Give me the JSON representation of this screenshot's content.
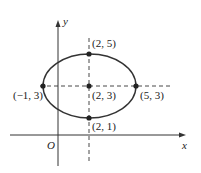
{
  "diagram": {
    "type": "ellipse-on-axes",
    "axes": {
      "x_label": "x",
      "y_label": "y",
      "origin_label": "O"
    },
    "ellipse": {
      "center": [
        2,
        3
      ],
      "semi_major_x": 3,
      "semi_minor_y": 2
    },
    "points": [
      {
        "label": "(2, 5)",
        "x": 2,
        "y": 5
      },
      {
        "label": "(2, 3)",
        "x": 2,
        "y": 3
      },
      {
        "label": "(−1, 3)",
        "x": -1,
        "y": 3
      },
      {
        "label": "(5, 3)",
        "x": 5,
        "y": 3
      },
      {
        "label": "(2, 1)",
        "x": 2,
        "y": 1
      }
    ],
    "colors": {
      "line": "#333333",
      "point": "#222222"
    }
  }
}
